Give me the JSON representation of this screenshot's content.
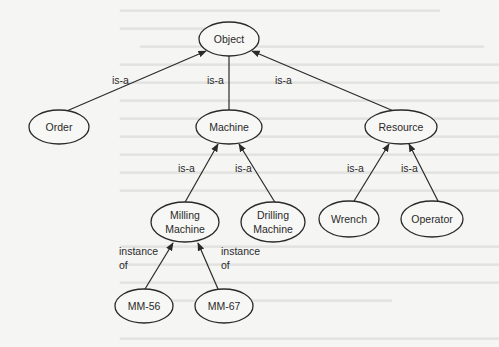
{
  "diagram": {
    "type": "class-hierarchy",
    "nodes": {
      "object": {
        "label": "Object"
      },
      "order": {
        "label": "Order"
      },
      "machine": {
        "label": "Machine"
      },
      "resource": {
        "label": "Resource"
      },
      "milling_machine": {
        "line1": "Milling",
        "line2": "Machine"
      },
      "drilling_machine": {
        "line1": "Drilling",
        "line2": "Machine"
      },
      "wrench": {
        "label": "Wrench"
      },
      "operator": {
        "label": "Operator"
      },
      "mm56": {
        "label": "MM-56"
      },
      "mm67": {
        "label": "MM-67"
      }
    },
    "edges": {
      "order_object": {
        "label": "is-a",
        "from": "Order",
        "to": "Object"
      },
      "machine_object": {
        "label": "is-a",
        "from": "Machine",
        "to": "Object"
      },
      "resource_object": {
        "label": "is-a",
        "from": "Resource",
        "to": "Object"
      },
      "milling_machine": {
        "label": "is-a",
        "from": "Milling Machine",
        "to": "Machine"
      },
      "drilling_machine": {
        "label": "is-a",
        "from": "Drilling Machine",
        "to": "Machine"
      },
      "wrench_resource": {
        "label": "is-a",
        "from": "Wrench",
        "to": "Resource"
      },
      "operator_resource": {
        "label": "is-a",
        "from": "Operator",
        "to": "Resource"
      },
      "mm56_milling": {
        "line1": "instance",
        "line2": "of",
        "from": "MM-56",
        "to": "Milling Machine"
      },
      "mm67_milling": {
        "line1": "instance",
        "line2": "of",
        "from": "MM-67",
        "to": "Milling Machine"
      }
    }
  },
  "colors": {
    "background": "#f5f5f3",
    "stroke": "#2a2a2a",
    "bleed_text": "#e2e2df"
  }
}
